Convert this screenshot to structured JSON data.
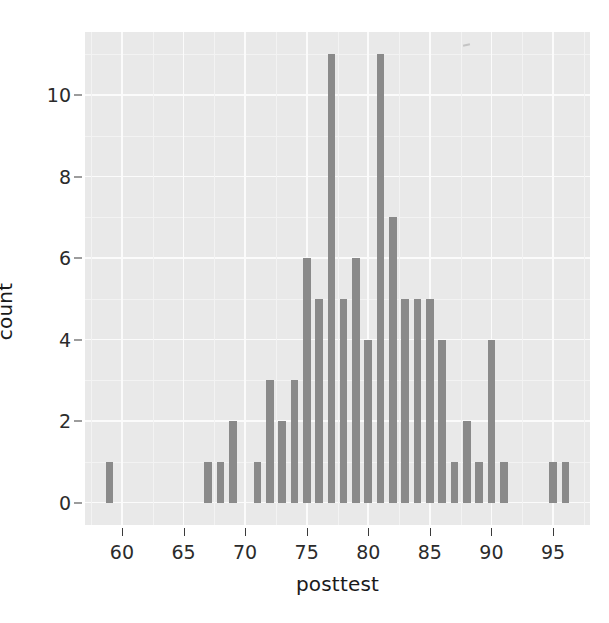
{
  "chart_data": {
    "type": "bar",
    "title": "",
    "subtitle": "",
    "xlabel": "posttest",
    "ylabel": "count",
    "xlim": [
      57.0,
      98.0
    ],
    "ylim": [
      -0.55,
      11.55
    ],
    "x_ticks": [
      60,
      65,
      70,
      75,
      80,
      85,
      90,
      95
    ],
    "x_tick_labels": [
      "60",
      "65",
      "70",
      "75",
      "80",
      "85",
      "90",
      "95"
    ],
    "y_ticks": [
      0,
      2,
      4,
      6,
      8,
      10
    ],
    "y_tick_labels": [
      "0",
      "2",
      "4",
      "6",
      "8",
      "10"
    ],
    "grid": true,
    "grid_major_color": "#fbfbfb",
    "grid_minor_color": "#f3f3f3",
    "panel_background": "#e9e9e9",
    "bar_color": "#8a8a8a",
    "legend": null,
    "legend_position": "none",
    "bar_width_units": 0.62,
    "binwidth": 1,
    "x": [
      59,
      67,
      68,
      69,
      71,
      72,
      73,
      74,
      75,
      76,
      77,
      78,
      79,
      80,
      81,
      82,
      83,
      84,
      85,
      86,
      87,
      88,
      89,
      90,
      91,
      95,
      96
    ],
    "values": [
      1,
      1,
      1,
      2,
      1,
      3,
      2,
      3,
      6,
      5,
      11,
      5,
      6,
      4,
      11,
      7,
      5,
      5,
      5,
      4,
      1,
      2,
      1,
      4,
      1,
      1,
      1
    ],
    "categories": [
      "59",
      "67",
      "68",
      "69",
      "71",
      "72",
      "73",
      "74",
      "75",
      "76",
      "77",
      "78",
      "79",
      "80",
      "81",
      "82",
      "83",
      "84",
      "85",
      "86",
      "87",
      "88",
      "89",
      "90",
      "91",
      "95",
      "96"
    ],
    "max_value": 11,
    "total_count": 99
  },
  "axes": {
    "x_title": "posttest",
    "y_title": "count"
  }
}
